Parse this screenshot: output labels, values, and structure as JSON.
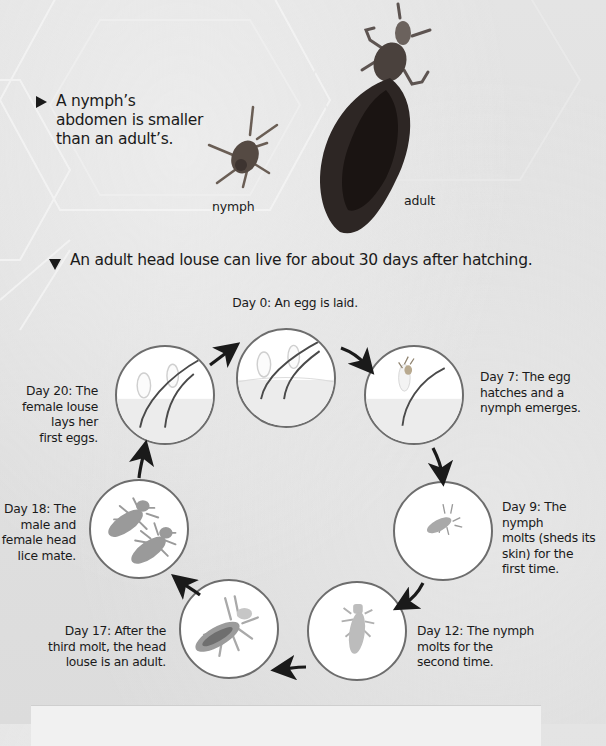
{
  "top_section": {
    "bullet_icon": "right-triangle-icon",
    "bullet_text_lines": [
      "A nymph’s",
      "abdomen is smaller",
      "than an adult’s."
    ],
    "photos": [
      {
        "label": "nymph"
      },
      {
        "label": "adult"
      }
    ]
  },
  "lifecycle_section": {
    "bullet_icon": "down-triangle-icon",
    "heading": "An adult head louse can live for about 30 days after hatching.",
    "stages": [
      {
        "day": "Day 0",
        "caption_lines": [
          "Day 0: An egg is laid."
        ],
        "image": "eggs-on-hair"
      },
      {
        "day": "Day 7",
        "caption_lines": [
          "Day 7: The egg",
          "hatches and a",
          "nymph emerges."
        ],
        "image": "hatching-nymph"
      },
      {
        "day": "Day 9",
        "caption_lines": [
          "Day 9: The nymph",
          "molts (sheds its",
          "skin) for the",
          "first time."
        ],
        "image": "small-nymph"
      },
      {
        "day": "Day 12",
        "caption_lines": [
          "Day 12: The nymph",
          "molts for the",
          "second time."
        ],
        "image": "larger-nymph"
      },
      {
        "day": "Day 17",
        "caption_lines": [
          "Day 17: After the",
          "third molt, the head",
          "louse is an adult."
        ],
        "image": "adult-louse"
      },
      {
        "day": "Day 18",
        "caption_lines": [
          "Day 18: The",
          "male and",
          "female head",
          "lice mate."
        ],
        "image": "mating-lice"
      },
      {
        "day": "Day 20",
        "caption_lines": [
          "Day 20: The",
          "female louse",
          "lays her",
          "first eggs."
        ],
        "image": "eggs-laid"
      }
    ]
  },
  "colors": {
    "background": "#dedede",
    "circle_border": "#6d6d6d",
    "circle_fill": "#ffffff",
    "arrow": "#1a1a1a",
    "text": "#1a1a1a"
  }
}
